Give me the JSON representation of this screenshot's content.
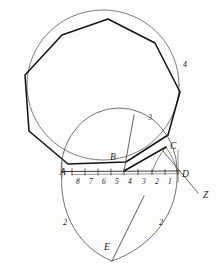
{
  "figure": {
    "kind": "geometric-construction-diagram",
    "ink_color": "#141414",
    "thin_color": "#55514c",
    "paper_color": "#fdfdfc"
  },
  "point_labels": [
    {
      "id": "A",
      "text": "A",
      "x": 60,
      "y": 168
    },
    {
      "id": "B",
      "text": "B",
      "x": 110,
      "y": 153
    },
    {
      "id": "C",
      "text": "C",
      "x": 170,
      "y": 142
    },
    {
      "id": "D",
      "text": "D",
      "x": 182,
      "y": 170
    },
    {
      "id": "E",
      "text": "E",
      "x": 104,
      "y": 243
    },
    {
      "id": "Z",
      "text": "Z",
      "x": 203,
      "y": 191
    }
  ],
  "number_labels": [
    {
      "id": "n3",
      "text": "3",
      "x": 148,
      "y": 114
    },
    {
      "id": "n4",
      "text": "4",
      "x": 183,
      "y": 61
    },
    {
      "id": "n2-left",
      "text": "2",
      "x": 63,
      "y": 219
    },
    {
      "id": "n2-right",
      "text": "2",
      "x": 159,
      "y": 219
    }
  ],
  "ruler": {
    "baseline_y": 173,
    "tick_labels": [
      "8",
      "7",
      "6",
      "5",
      "4",
      "3",
      "2",
      "1"
    ],
    "tick_label_y": 180,
    "tick_label_x": [
      79,
      92,
      105,
      118,
      131,
      145,
      158,
      171
    ]
  },
  "geometry": {
    "outer_circle": {
      "cx": 103,
      "cy": 85,
      "r": 75
    },
    "nonagon_vertices": "108,19 155,43 180,92 168,135 126,162 68,164 29,131 25,75 62,35",
    "upper_arc": {
      "cx": 118,
      "cy": 172,
      "rx": 57,
      "ry": 60
    },
    "teardrop_apex": {
      "x": 112,
      "y": 261
    },
    "segment_b_to_top": {
      "x1": 124,
      "y1": 171,
      "x2": 133,
      "y2": 115
    },
    "segment_a_to_c": {
      "x1": 68,
      "y1": 166,
      "x2": 166,
      "y2": 147
    },
    "segment_c_to_z": {
      "x1": 166,
      "y1": 147,
      "x2": 198,
      "y2": 194
    },
    "segment_apex_ray": {
      "x1": 112,
      "y1": 261,
      "x2": 143,
      "y2": 198
    }
  }
}
